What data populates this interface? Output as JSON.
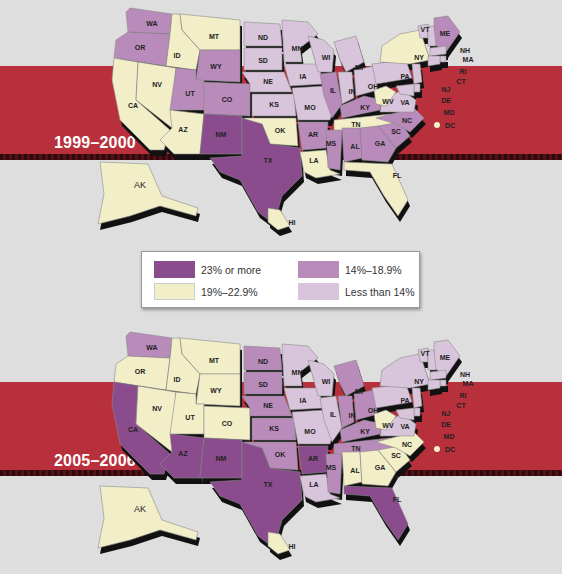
{
  "colors": {
    "background": "#dedede",
    "band": "#b8303c",
    "cat_23_plus": "#8a4c8c",
    "cat_19_22": "#f2eec8",
    "cat_14_18": "#b98bbb",
    "cat_lt14": "#d8c5db"
  },
  "legend": {
    "items": [
      {
        "label": "23% or more",
        "color": "#8a4c8c"
      },
      {
        "label": "19%–22.9%",
        "color": "#f2eec8"
      },
      {
        "label": "14%–18.9%",
        "color": "#b98bbb"
      },
      {
        "label": "Less than 14%",
        "color": "#d8c5db"
      }
    ]
  },
  "maps": [
    {
      "period": "1999–2000",
      "states": {
        "WA": "14",
        "OR": "14",
        "CA": "19",
        "NV": "19",
        "ID": "19",
        "MT": "19",
        "WY": "14",
        "UT": "14",
        "CO": "14",
        "AZ": "19",
        "NM": "23",
        "ND": "lt",
        "SD": "lt",
        "NE": "lt",
        "KS": "lt",
        "OK": "19",
        "TX": "23",
        "MN": "lt",
        "IA": "lt",
        "MO": "lt",
        "AR": "14",
        "LA": "19",
        "WI": "lt",
        "IL": "14",
        "MI": "lt",
        "IN": "lt",
        "OH": "lt",
        "KY": "14",
        "TN": "19",
        "MS": "14",
        "AL": "14",
        "GA": "14",
        "FL": "19",
        "SC": "14",
        "NC": "14",
        "VA": "lt",
        "WV": "19",
        "PA": "lt",
        "NY": "19",
        "VT": "lt",
        "ME": "14",
        "NH": "lt",
        "MA": "lt",
        "RI": "lt",
        "CT": "lt",
        "NJ": "lt",
        "DE": "lt",
        "MD": "lt",
        "DC": "19",
        "AK": "19",
        "HI": "19"
      }
    },
    {
      "period": "2005–2006",
      "states": {
        "WA": "14",
        "OR": "19",
        "CA": "23",
        "NV": "19",
        "ID": "19",
        "MT": "19",
        "WY": "19",
        "UT": "19",
        "CO": "19",
        "AZ": "23",
        "NM": "23",
        "ND": "14",
        "SD": "14",
        "NE": "14",
        "KS": "14",
        "OK": "14",
        "TX": "23",
        "MN": "lt",
        "IA": "lt",
        "MO": "lt",
        "AR": "23",
        "LA": "lt",
        "WI": "lt",
        "IL": "lt",
        "MI": "14",
        "IN": "14",
        "OH": "14",
        "KY": "14",
        "TN": "14",
        "MS": "14",
        "AL": "19",
        "GA": "19",
        "FL": "23",
        "SC": "19",
        "NC": "19",
        "VA": "lt",
        "WV": "19",
        "PA": "lt",
        "NY": "lt",
        "VT": "lt",
        "ME": "lt",
        "NH": "lt",
        "MA": "lt",
        "RI": "lt",
        "CT": "lt",
        "NJ": "lt",
        "DE": "lt",
        "MD": "lt",
        "DC": "19",
        "AK": "19",
        "HI": "19"
      }
    }
  ],
  "labels": {
    "WA": "WA",
    "OR": "OR",
    "CA": "CA",
    "NV": "NV",
    "ID": "ID",
    "MT": "MT",
    "WY": "WY",
    "UT": "UT",
    "CO": "CO",
    "AZ": "AZ",
    "NM": "NM",
    "ND": "ND",
    "SD": "SD",
    "NE": "NE",
    "KS": "KS",
    "OK": "OK",
    "TX": "TX",
    "MN": "MN",
    "IA": "IA",
    "MO": "MO",
    "AR": "AR",
    "LA": "LA",
    "WI": "WI",
    "IL": "IL",
    "MI": "MI",
    "IN": "IN",
    "OH": "OH",
    "KY": "KY",
    "TN": "TN",
    "MS": "MS",
    "AL": "AL",
    "GA": "GA",
    "FL": "FL",
    "SC": "SC",
    "NC": "NC",
    "VA": "VA",
    "WV": "WV",
    "PA": "PA",
    "NY": "NY",
    "VT": "VT",
    "ME": "ME",
    "NH": "NH",
    "MA": "MA",
    "RI": "RI",
    "CT": "CT",
    "NJ": "NJ",
    "DE": "DE",
    "MD": "MD",
    "DC": "DC",
    "AK": "AK",
    "HI": "HI"
  }
}
